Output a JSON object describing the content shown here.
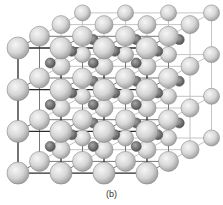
{
  "figure": {
    "caption": "(b)",
    "grid": {
      "nx": 4,
      "ny": 4,
      "nz": 4,
      "origin": [
        18,
        48
      ],
      "step_x": 43,
      "step_y": 41.7,
      "depth_offset": [
        21.5,
        -11.7
      ]
    },
    "atoms": {
      "corner": {
        "color_light": "#f2f2f2",
        "color_dark": "#9a9a9a",
        "stroke": "#8a8a8a",
        "radius_front": 11,
        "radius_back": 8
      },
      "body_center": {
        "color_light": "#9a9a9a",
        "color_dark": "#4e4e4e",
        "stroke": "#555555",
        "radius": 5
      }
    },
    "bonds": {
      "front_color": "#2a2a2a",
      "back_color": "#c4c4c4",
      "mid_color": "#777777"
    }
  }
}
